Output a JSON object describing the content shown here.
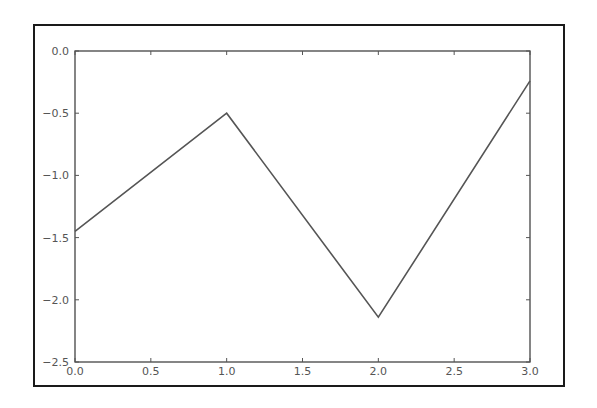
{
  "chart_data": {
    "type": "line",
    "title": "",
    "xlabel": "",
    "ylabel": "",
    "x": [
      0,
      1,
      2,
      3
    ],
    "series": [
      {
        "name": "line",
        "values": [
          -1.45,
          -0.5,
          -2.14,
          -0.24
        ],
        "color": "#555555"
      }
    ],
    "xlim": [
      0.0,
      3.0
    ],
    "ylim": [
      -2.5,
      0.0
    ],
    "xticks": [
      "0.0",
      "0.5",
      "1.0",
      "1.5",
      "2.0",
      "2.5",
      "3.0"
    ],
    "yticks": [
      "0.0",
      "-0.5",
      "-1.0",
      "-1.5",
      "-2.0",
      "-2.5"
    ],
    "grid": false,
    "legend": null
  }
}
